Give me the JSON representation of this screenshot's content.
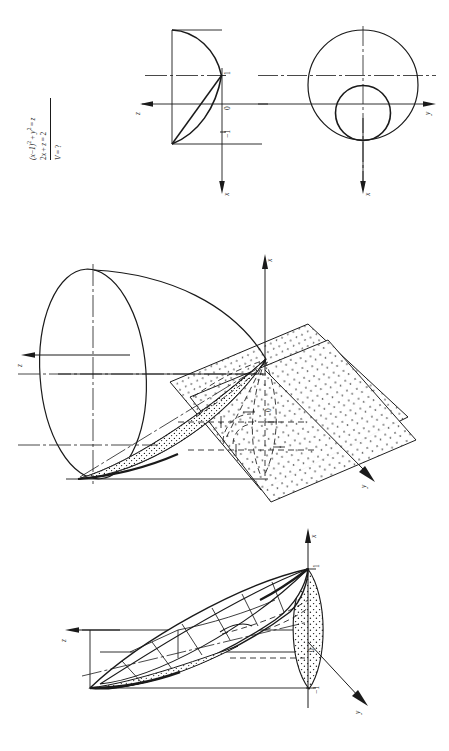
{
  "page": {
    "orientation": "landscape-content-rotated-90ccw",
    "background": "#ffffff",
    "ink": "#1a1a1a"
  },
  "problem": {
    "equation_surface": "(x−1)² + y² = z",
    "equation_plane": "2x + z = 2",
    "question": "V = ?",
    "surface_lhs": "(x−1)",
    "surface_exp1": "2",
    "surface_mid": "+ y",
    "surface_exp2": "2",
    "surface_rhs": "= z",
    "plane_text": "2x + z = 2",
    "volume_text": "V = ?"
  },
  "figures": [
    {
      "id": "fig-projections",
      "name": "orthographic-projections",
      "caption": "",
      "axes": [
        {
          "name": "z",
          "label": "z",
          "direction": "left"
        },
        {
          "name": "y",
          "label": "y",
          "direction": "right"
        },
        {
          "name": "x-front",
          "label": "x",
          "direction": "down"
        },
        {
          "name": "x-side",
          "label": "x",
          "direction": "down"
        }
      ],
      "ticks": [
        {
          "label": "1",
          "value": 1
        },
        {
          "label": "0",
          "value": 0
        },
        {
          "label": "−1",
          "value": -1
        }
      ],
      "elements": [
        "parabola-profile",
        "cutting-line",
        "large-circle-radius-2",
        "small-circle-radius-1",
        "centre-lines",
        "projection-bounding-lines"
      ]
    },
    {
      "id": "fig-axonometric-planes",
      "name": "axonometric-view-with-cutting-planes",
      "caption": "",
      "axes": [
        {
          "name": "x",
          "label": "x",
          "direction": "up"
        },
        {
          "name": "z",
          "label": "z",
          "direction": "left"
        },
        {
          "name": "y",
          "label": "y",
          "direction": "down-right"
        }
      ],
      "ticks": [
        {
          "label": "0",
          "value": 0
        }
      ],
      "elements": [
        "paraboloid-surface",
        "elliptical-rim",
        "stippled-coordinate-plane-1",
        "stippled-coordinate-plane-2",
        "dashed-construction-lines",
        "hatched-section",
        "dash-dot-axis-lines"
      ]
    },
    {
      "id": "fig-axonometric-solid",
      "name": "axonometric-view-of-solid",
      "caption": "",
      "axes": [
        {
          "name": "x",
          "label": "x",
          "direction": "up"
        },
        {
          "name": "z",
          "label": "z",
          "direction": "left"
        },
        {
          "name": "y",
          "label": "y",
          "direction": "down-right"
        }
      ],
      "ticks": [
        {
          "label": "1",
          "value": 1
        },
        {
          "label": "0",
          "value": 0
        },
        {
          "label": "−1",
          "value": -1
        }
      ],
      "elements": [
        "oblique-elliptical-cone",
        "stippled-end-cap",
        "hatched-cut-surface",
        "generator-lines",
        "dash-dot-axis-line",
        "projection-box-lines"
      ]
    }
  ]
}
